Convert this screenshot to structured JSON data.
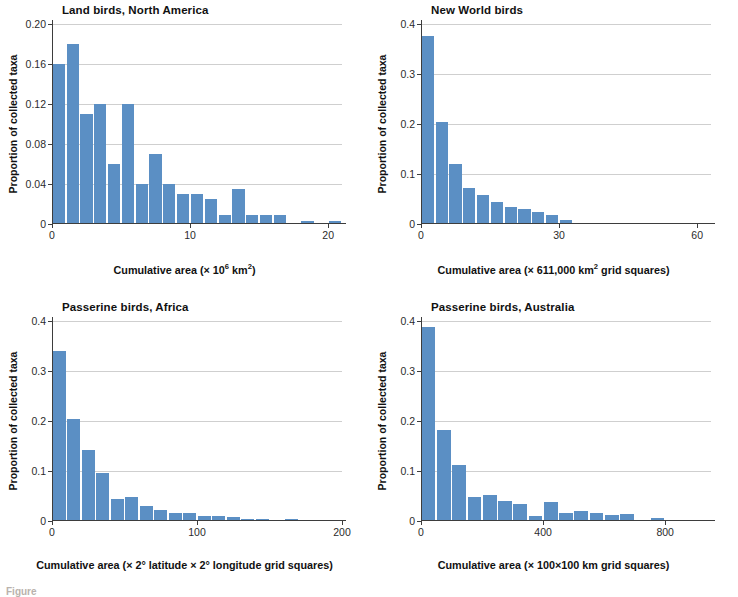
{
  "figure": {
    "caption_partial": "Figure"
  },
  "chart_data": [
    {
      "type": "bar",
      "panel_id": "land-birds-north-america",
      "title": "Land birds, North America",
      "xlabel": "Cumulative area (× 10⁶ km²)",
      "xlabel_prefix": "Cumulative area (× 10",
      "xlabel_exp1": "6",
      "xlabel_mid": " km",
      "xlabel_exp2": "2",
      "xlabel_suffix": ")",
      "ylabel": "Proportion of collected taxa",
      "xlim": [
        0,
        21
      ],
      "ylim": [
        0,
        0.2
      ],
      "xticks": [
        0,
        10,
        20
      ],
      "xtick_labels": [
        "0",
        "10",
        "20"
      ],
      "yticks": [
        0,
        0.04,
        0.08,
        0.12,
        0.16,
        0.2
      ],
      "ytick_labels": [
        "0",
        "0.04",
        "0.08",
        "0.12",
        "0.16",
        "0.20"
      ],
      "grid": true,
      "bin_width": 1,
      "bin_starts": [
        0,
        1,
        2,
        3,
        4,
        5,
        6,
        7,
        8,
        9,
        10,
        11,
        12,
        13,
        14,
        15,
        16,
        17,
        18,
        19,
        20
      ],
      "values": [
        0.16,
        0.18,
        0.11,
        0.12,
        0.06,
        0.12,
        0.04,
        0.07,
        0.04,
        0.03,
        0.03,
        0.025,
        0.009,
        0.035,
        0.009,
        0.009,
        0.009,
        0.0,
        0.003,
        0.0,
        0.003
      ]
    },
    {
      "type": "bar",
      "panel_id": "new-world-birds",
      "title": "New World birds",
      "xlabel": "Cumulative area (× 611,000 km² grid squares)",
      "xlabel_prefix": "Cumulative area (× 611,000 km",
      "xlabel_exp1": "2",
      "xlabel_suffix": " grid squares)",
      "ylabel": "Proportion of collected taxa",
      "xlim": [
        0,
        63
      ],
      "ylim": [
        0,
        0.4
      ],
      "xticks": [
        0,
        30,
        60
      ],
      "xtick_labels": [
        "0",
        "30",
        "60"
      ],
      "yticks": [
        0,
        0.1,
        0.2,
        0.3,
        0.4
      ],
      "ytick_labels": [
        "0",
        "0.1",
        "0.2",
        "0.3",
        "0.4"
      ],
      "grid": true,
      "bin_width": 3,
      "bin_starts": [
        0,
        3,
        6,
        9,
        12,
        15,
        18,
        21,
        24,
        27,
        30,
        33,
        36,
        39,
        42,
        45,
        48,
        51,
        54,
        57,
        60
      ],
      "values": [
        0.376,
        0.205,
        0.12,
        0.072,
        0.059,
        0.045,
        0.034,
        0.031,
        0.024,
        0.019,
        0.008,
        0.003,
        0.003,
        0.002,
        0.003,
        0.003,
        0.002,
        0.0,
        0.002,
        0.0,
        0.0
      ]
    },
    {
      "type": "bar",
      "panel_id": "passerine-birds-africa",
      "title": "Passerine birds, Africa",
      "xlabel": "Cumulative area (× 2° latitude × 2° longitude grid squares)",
      "ylabel": "Proportion of collected taxa",
      "xlim": [
        0,
        200
      ],
      "ylim": [
        0,
        0.4
      ],
      "xticks": [
        0,
        100,
        200
      ],
      "xtick_labels": [
        "0",
        "100",
        "200"
      ],
      "yticks": [
        0,
        0.1,
        0.2,
        0.3,
        0.4
      ],
      "ytick_labels": [
        "0",
        "0.1",
        "0.2",
        "0.3",
        "0.4"
      ],
      "grid": true,
      "bin_width": 10,
      "bin_starts": [
        0,
        10,
        20,
        30,
        40,
        50,
        60,
        70,
        80,
        90,
        100,
        110,
        120,
        130,
        140,
        150,
        160,
        170,
        180,
        190
      ],
      "values": [
        0.34,
        0.205,
        0.143,
        0.097,
        0.045,
        0.048,
        0.031,
        0.022,
        0.016,
        0.016,
        0.01,
        0.01,
        0.009,
        0.004,
        0.004,
        0.0,
        0.004,
        0.0,
        0.0,
        0.0
      ]
    },
    {
      "type": "bar",
      "panel_id": "passerine-birds-australia",
      "title": "Passerine birds, Australia",
      "xlabel": "Cumulative area (× 100×100 km grid squares)",
      "ylabel": "Proportion of collected taxa",
      "xlim": [
        0,
        950
      ],
      "ylim": [
        0,
        0.4
      ],
      "xticks": [
        0,
        400,
        800
      ],
      "xtick_labels": [
        "0",
        "400",
        "800"
      ],
      "yticks": [
        0,
        0.1,
        0.2,
        0.3,
        0.4
      ],
      "ytick_labels": [
        "0",
        "0.1",
        "0.2",
        "0.3",
        "0.4"
      ],
      "grid": true,
      "bin_width": 50,
      "bin_starts": [
        0,
        50,
        100,
        150,
        200,
        250,
        300,
        350,
        400,
        450,
        500,
        550,
        600,
        650,
        700,
        750,
        800,
        850,
        900
      ],
      "values": [
        0.388,
        0.183,
        0.113,
        0.049,
        0.053,
        0.04,
        0.034,
        0.01,
        0.039,
        0.016,
        0.021,
        0.016,
        0.012,
        0.015,
        0.003,
        0.007,
        0.0,
        0.0,
        0.0
      ]
    }
  ],
  "colors": {
    "bar": "#5b8fc4",
    "axis": "#3d3d3d",
    "grid": "#cfcfcf",
    "text": "#111111"
  }
}
